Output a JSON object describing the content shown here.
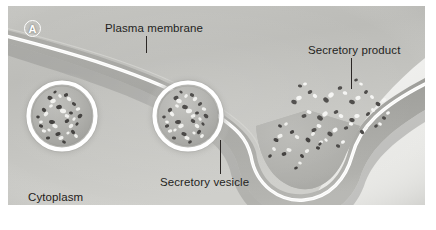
{
  "figure": {
    "panel_letter": "A",
    "background_color": "#ffffff",
    "panel_background_color": "#c9c9c6"
  },
  "labels": {
    "plasma_membrane": "Plasma membrane",
    "secretory_product": "Secretory product",
    "secretory_vesicle": "Secretory vesicle",
    "cytoplasm": "Cytoplasm"
  },
  "colors": {
    "cytoplasm_mid": "#b9b9b5",
    "cytoplasm_dark": "#9a9a96",
    "extracellular": "#f2f2f0",
    "membrane_line": "#ffffff",
    "membrane_shadow": "#8d8d89",
    "label_text": "#241f1d",
    "leader_line": "#2b2725",
    "granule_dark": "#3c3a38",
    "granule_light": "#efefec"
  },
  "structures": {
    "vesicles": [
      {
        "name": "secretory-vesicle-left",
        "cx": 62,
        "cy": 116,
        "r": 38
      },
      {
        "name": "secretory-vesicle-right",
        "cx": 188,
        "cy": 116,
        "r": 38
      }
    ],
    "fusion_pore": {
      "name": "fusing-vesicle-pore",
      "cx": 300,
      "cy": 170
    },
    "granule_counts": {
      "vesicle_left": 34,
      "vesicle_right": 34,
      "fusion_pore": 18,
      "released_product": 44
    }
  }
}
